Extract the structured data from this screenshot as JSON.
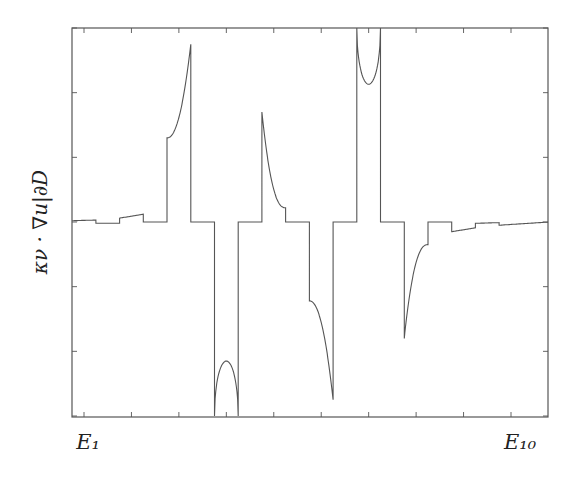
{
  "chart_data": {
    "type": "line",
    "title": "",
    "xlabel": "",
    "ylabel": "κν · ∇u|∂D",
    "x_tick_labels": [
      "E1",
      "E10"
    ],
    "x_tick_count": 10,
    "y_tick_count": 7,
    "grid": false,
    "legend": null,
    "xlim": [
      0.75,
      10.8
    ],
    "ylim": [
      -3,
      3
    ],
    "series": [
      {
        "name": "normal derivative on boundary",
        "segments": [
          {
            "x_range": [
              0.75,
              1.25
            ],
            "shape": "flat",
            "y": [
              0.02,
              0.03
            ]
          },
          {
            "x_range": [
              1.25,
              1.75
            ],
            "shape": "flat",
            "y": [
              -0.02,
              -0.02
            ]
          },
          {
            "x_range": [
              1.75,
              2.25
            ],
            "shape": "ramp",
            "y": [
              0.06,
              0.12
            ]
          },
          {
            "x_range": [
              2.25,
              2.75
            ],
            "shape": "flat",
            "y": [
              0,
              0
            ]
          },
          {
            "x_range": [
              2.75,
              3.25
            ],
            "shape": "convex-rise",
            "y": [
              1.3,
              2.75
            ]
          },
          {
            "x_range": [
              3.25,
              3.75
            ],
            "shape": "flat",
            "y": [
              0,
              0
            ]
          },
          {
            "x_range": [
              3.75,
              4.25
            ],
            "shape": "arch",
            "y": [
              -3.0,
              -2.15,
              -3.0
            ]
          },
          {
            "x_range": [
              4.25,
              4.75
            ],
            "shape": "flat",
            "y": [
              0,
              0
            ]
          },
          {
            "x_range": [
              4.75,
              5.25
            ],
            "shape": "decay",
            "y": [
              1.7,
              0.22
            ]
          },
          {
            "x_range": [
              5.25,
              5.75
            ],
            "shape": "flat",
            "y": [
              0,
              0
            ]
          },
          {
            "x_range": [
              5.75,
              6.25
            ],
            "shape": "convex-drop",
            "y": [
              -1.22,
              -2.75
            ]
          },
          {
            "x_range": [
              6.25,
              6.75
            ],
            "shape": "flat",
            "y": [
              0,
              0
            ]
          },
          {
            "x_range": [
              6.75,
              7.25
            ],
            "shape": "u-shape",
            "y": [
              3.0,
              2.13,
              3.0
            ]
          },
          {
            "x_range": [
              7.25,
              7.75
            ],
            "shape": "flat",
            "y": [
              0,
              0
            ]
          },
          {
            "x_range": [
              7.75,
              8.25
            ],
            "shape": "recovery",
            "y": [
              -1.8,
              -0.35
            ]
          },
          {
            "x_range": [
              8.25,
              8.75
            ],
            "shape": "flat",
            "y": [
              0,
              0
            ]
          },
          {
            "x_range": [
              8.75,
              9.25
            ],
            "shape": "ramp",
            "y": [
              -0.15,
              -0.09
            ]
          },
          {
            "x_range": [
              9.25,
              9.75
            ],
            "shape": "ramp",
            "y": [
              -0.02,
              -0.01
            ]
          },
          {
            "x_range": [
              9.75,
              10.8
            ],
            "shape": "ramp",
            "y": [
              -0.05,
              0.0
            ]
          }
        ]
      }
    ]
  },
  "axes": {
    "ylabel": "κν · ∇u|∂D",
    "xtick_first": "E₁",
    "xtick_last": "E₁₀"
  },
  "colors": {
    "line": "#555555",
    "frame": "#555555"
  }
}
